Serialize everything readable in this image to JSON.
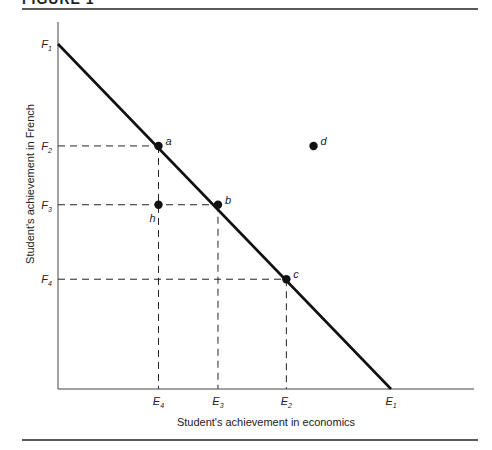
{
  "figure": {
    "title": "FIGURE 1"
  },
  "chart_data": {
    "type": "line",
    "title": "FIGURE 1",
    "xlabel": "Student's achievement in economics",
    "ylabel": "Student's achievement in French",
    "colors": {
      "ink": "#111111",
      "guide": "#222222"
    },
    "axes": {
      "xlim": [
        0,
        1
      ],
      "ylim": [
        0,
        1
      ],
      "grid": false
    },
    "frontier": {
      "name": "production possibility frontier",
      "from": {
        "x": 0,
        "y": 1,
        "label": "F",
        "sub": "1"
      },
      "to": {
        "x": 1,
        "y": 0,
        "label": "E",
        "sub": "1"
      }
    },
    "y_ticks": [
      {
        "label": "F",
        "sub": "1",
        "value": 1.0
      },
      {
        "label": "F",
        "sub": "2",
        "value": 0.7045
      },
      {
        "label": "F",
        "sub": "3",
        "value": 0.5341
      },
      {
        "label": "F",
        "sub": "4",
        "value": 0.3182
      }
    ],
    "x_ticks": [
      {
        "label": "E",
        "sub": "4",
        "value": 0.3018
      },
      {
        "label": "E",
        "sub": "3",
        "value": 0.4804
      },
      {
        "label": "E",
        "sub": "2",
        "value": 0.6858
      },
      {
        "label": "E",
        "sub": "1",
        "value": 1.0
      }
    ],
    "points": [
      {
        "name": "a",
        "x": 0.3018,
        "y": 0.7045,
        "label_side": "right"
      },
      {
        "name": "b",
        "x": 0.4804,
        "y": 0.5341,
        "label_side": "right"
      },
      {
        "name": "c",
        "x": 0.6858,
        "y": 0.3182,
        "label_side": "right"
      },
      {
        "name": "d",
        "x": 0.7674,
        "y": 0.7045,
        "label_side": "right"
      },
      {
        "name": "h",
        "x": 0.3018,
        "y": 0.5341,
        "label_side": "below"
      }
    ],
    "guides": [
      {
        "from_point": "a",
        "to_axes": [
          "x",
          "y"
        ]
      },
      {
        "from_point": "b",
        "to_axes": [
          "x",
          "y"
        ]
      },
      {
        "from_point": "c",
        "to_axes": [
          "x",
          "y"
        ]
      }
    ]
  }
}
